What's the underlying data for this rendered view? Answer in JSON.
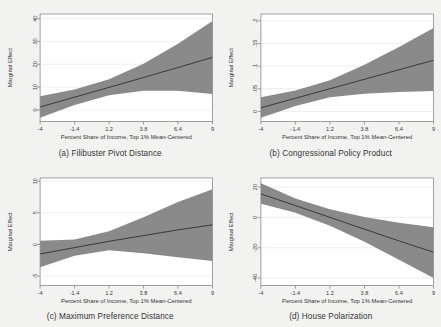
{
  "figure": {
    "background_color": "#f2f2f0",
    "panel_background_color": "#ffffff",
    "band_color": "#808080",
    "line_color": "#2b2b2b"
  },
  "shared": {
    "xlabel": "Percent Share of Income, Top 1% Mean-Centered",
    "ylabel": "Marginal Effect",
    "xticks": [
      "-4",
      "-1.4",
      "1.2",
      "3.8",
      "6.4",
      "9"
    ],
    "xtick_values": [
      -4,
      -1.4,
      1.2,
      3.8,
      6.4,
      9
    ],
    "xlim": [
      -4,
      9
    ]
  },
  "chart_data": [
    {
      "type": "line",
      "panel": "a",
      "title": "(a) Filibuster Pivot Distance",
      "xlabel": "Percent Share of Income, Top 1% Mean-Centered",
      "ylabel": "Marginal Effect",
      "xlim": [
        -4,
        9
      ],
      "ylim": [
        -5,
        42
      ],
      "yticks": [
        "0",
        "10",
        "20",
        "30",
        "40"
      ],
      "ytick_values": [
        0,
        10,
        20,
        30,
        40
      ],
      "grid": true,
      "x": [
        -4,
        -1.4,
        1.2,
        3.8,
        6.4,
        9
      ],
      "series": [
        {
          "name": "Marginal effect",
          "values": [
            1.3,
            5.6,
            9.9,
            14.2,
            18.6,
            23.0
          ]
        },
        {
          "name": "CI lower",
          "values": [
            -3.4,
            2.2,
            6.4,
            8.4,
            8.4,
            7.0
          ]
        },
        {
          "name": "CI upper",
          "values": [
            6.0,
            9.0,
            13.4,
            20.2,
            29.0,
            39.0
          ]
        }
      ]
    },
    {
      "type": "line",
      "panel": "b",
      "title": "(b) Congressional Policy Product",
      "xlabel": "Percent Share of Income, Top 1% Mean-Centered",
      "ylabel": "Marginal Effect",
      "xlim": [
        -4,
        9
      ],
      "ylim": [
        -0.022,
        0.215
      ],
      "yticks": [
        "0",
        ".05",
        ".1",
        ".15",
        ".2"
      ],
      "ytick_values": [
        0,
        0.05,
        0.1,
        0.15,
        0.2
      ],
      "grid": true,
      "x": [
        -4,
        -1.4,
        1.2,
        3.8,
        6.4,
        9
      ],
      "series": [
        {
          "name": "Marginal effect",
          "values": [
            0.008,
            0.029,
            0.05,
            0.071,
            0.092,
            0.113
          ]
        },
        {
          "name": "CI lower",
          "values": [
            -0.014,
            0.012,
            0.031,
            0.039,
            0.043,
            0.045
          ]
        },
        {
          "name": "CI upper",
          "values": [
            0.031,
            0.046,
            0.069,
            0.103,
            0.142,
            0.184
          ]
        }
      ]
    },
    {
      "type": "line",
      "panel": "c",
      "title": "(c) Maximum Preference Distance",
      "xlabel": "Percent Share of Income, Top 1% Mean-Centered",
      "ylabel": "Marginal Effect",
      "xlim": [
        -4,
        9
      ],
      "ylim": [
        -6.5,
        10.5
      ],
      "yticks": [
        "-5",
        "0",
        "5",
        "10"
      ],
      "ytick_values": [
        -5,
        0,
        5,
        10
      ],
      "grid": true,
      "x": [
        -4,
        -1.4,
        1.2,
        3.8,
        6.4,
        9
      ],
      "series": [
        {
          "name": "Marginal effect",
          "values": [
            -1.5,
            -0.5,
            0.5,
            1.4,
            2.3,
            3.1
          ]
        },
        {
          "name": "CI lower",
          "values": [
            -3.6,
            -1.8,
            -0.9,
            -1.4,
            -2.0,
            -2.6
          ]
        },
        {
          "name": "CI upper",
          "values": [
            0.6,
            0.8,
            2.1,
            4.3,
            6.7,
            8.7
          ]
        }
      ]
    },
    {
      "type": "line",
      "panel": "d",
      "title": "(d) House Polarization",
      "xlabel": "Percent Share of Income, Top 1% Mean-Centered",
      "ylabel": "Marginal Effect",
      "xlim": [
        -4,
        9
      ],
      "ylim": [
        -45,
        26
      ],
      "yticks": [
        "-40",
        "-20",
        "0",
        "20"
      ],
      "ytick_values": [
        -40,
        -20,
        0,
        20
      ],
      "grid": true,
      "x": [
        -4,
        -1.4,
        1.2,
        3.8,
        6.4,
        9
      ],
      "series": [
        {
          "name": "Marginal effect",
          "values": [
            15.5,
            7.8,
            0.0,
            -7.8,
            -15.5,
            -23.0
          ]
        },
        {
          "name": "CI lower",
          "values": [
            9.0,
            3.0,
            -5.5,
            -16.0,
            -28.0,
            -40.0
          ]
        },
        {
          "name": "CI upper",
          "values": [
            22.5,
            12.5,
            5.3,
            0.3,
            -3.5,
            -6.5
          ]
        }
      ]
    }
  ]
}
